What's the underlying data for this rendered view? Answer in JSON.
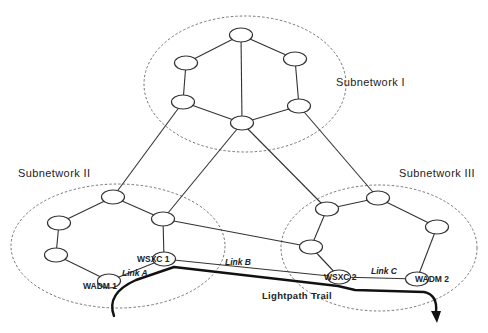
{
  "diagram": {
    "subnetworks": [
      {
        "id": "sn1",
        "label": "Subnetwork I",
        "cx": 245,
        "cy": 84,
        "rx": 101,
        "ry": 68,
        "label_x": 336,
        "label_y": 86
      },
      {
        "id": "sn2",
        "label": "Subnetwork II",
        "cx": 118,
        "cy": 246,
        "rx": 107,
        "ry": 62,
        "label_x": 18,
        "label_y": 177
      },
      {
        "id": "sn3",
        "label": "Subnetwork III",
        "cx": 379,
        "cy": 248,
        "rx": 98,
        "ry": 63,
        "label_x": 399,
        "label_y": 177
      }
    ],
    "nodes": [
      {
        "id": "n1_top",
        "x": 241,
        "y": 35,
        "label": ""
      },
      {
        "id": "n1_ul",
        "x": 186,
        "y": 63,
        "label": ""
      },
      {
        "id": "n1_ur",
        "x": 295,
        "y": 59,
        "label": ""
      },
      {
        "id": "n1_ll",
        "x": 183,
        "y": 102,
        "label": ""
      },
      {
        "id": "n1_lr",
        "x": 299,
        "y": 106,
        "label": ""
      },
      {
        "id": "n1_bot",
        "x": 242,
        "y": 123,
        "label": ""
      },
      {
        "id": "n2_top",
        "x": 113,
        "y": 197,
        "label": ""
      },
      {
        "id": "n2_ur",
        "x": 163,
        "y": 219,
        "label": ""
      },
      {
        "id": "n2_lu",
        "x": 59,
        "y": 223,
        "label": ""
      },
      {
        "id": "n2_ll",
        "x": 56,
        "y": 255,
        "label": ""
      },
      {
        "id": "wsxc1",
        "x": 164,
        "y": 259,
        "label": "WSXC 1"
      },
      {
        "id": "wadm1",
        "x": 109,
        "y": 281,
        "label": "WADM 1"
      },
      {
        "id": "n3_ul",
        "x": 327,
        "y": 209,
        "label": ""
      },
      {
        "id": "n3_top",
        "x": 378,
        "y": 198,
        "label": ""
      },
      {
        "id": "n3_r",
        "x": 437,
        "y": 227,
        "label": ""
      },
      {
        "id": "n3_lm",
        "x": 311,
        "y": 247,
        "label": ""
      },
      {
        "id": "wsxc2",
        "x": 339,
        "y": 277,
        "label": "WSXC 2"
      },
      {
        "id": "wadm2",
        "x": 417,
        "y": 279,
        "label": "WADM 2"
      }
    ],
    "node_labels": {
      "wsxc1": {
        "text": "WSXC 1",
        "x": 137,
        "y": 262
      },
      "wadm1": {
        "text": "WADM 1",
        "x": 83,
        "y": 289
      },
      "wsxc2": {
        "text": "WSXC 2",
        "x": 324,
        "y": 280
      },
      "wadm2": {
        "text": "WADM 2",
        "x": 415,
        "y": 282
      }
    },
    "link_labels": [
      {
        "text": "Link A",
        "x": 122,
        "y": 276
      },
      {
        "text": "Link B",
        "x": 225,
        "y": 265
      },
      {
        "text": "Link C",
        "x": 371,
        "y": 274
      }
    ],
    "trail_label": {
      "text": "Lightpath Trail",
      "x": 262,
      "y": 299
    },
    "links": [
      [
        "n1_top",
        "n1_ul"
      ],
      [
        "n1_top",
        "n1_ur"
      ],
      [
        "n1_top",
        "n1_bot"
      ],
      [
        "n1_ul",
        "n1_ll"
      ],
      [
        "n1_ur",
        "n1_lr"
      ],
      [
        "n1_ll",
        "n1_bot"
      ],
      [
        "n1_lr",
        "n1_bot"
      ],
      [
        "n1_ll",
        "n2_top"
      ],
      [
        "n1_bot",
        "n2_ur"
      ],
      [
        "n1_bot",
        "n3_ul"
      ],
      [
        "n1_lr",
        "n3_top"
      ],
      [
        "n2_top",
        "n2_ur"
      ],
      [
        "n2_top",
        "n2_lu"
      ],
      [
        "n2_lu",
        "n2_ll"
      ],
      [
        "n2_ll",
        "wadm1"
      ],
      [
        "n2_ur",
        "wsxc1"
      ],
      [
        "wadm1",
        "wsxc1"
      ],
      [
        "n2_ur",
        "n3_lm"
      ],
      [
        "wsxc1",
        "wsxc2"
      ],
      [
        "n3_ul",
        "n3_top"
      ],
      [
        "n3_top",
        "n3_r"
      ],
      [
        "n3_ul",
        "n3_lm"
      ],
      [
        "n3_lm",
        "wsxc2"
      ],
      [
        "n3_r",
        "wadm2"
      ],
      [
        "wsxc2",
        "wadm2"
      ]
    ]
  }
}
